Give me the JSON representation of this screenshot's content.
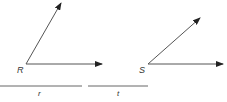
{
  "diagram": {
    "title": "",
    "angles": [
      {
        "vertex_label": "R",
        "vertex": [
          26,
          64
        ],
        "ray1_tip": [
          61,
          3
        ],
        "ray2_tip": [
          102,
          65
        ]
      },
      {
        "vertex_label": "S",
        "vertex": [
          148,
          64
        ],
        "ray1_tip": [
          200,
          18
        ],
        "ray2_tip": [
          223,
          64
        ]
      }
    ],
    "segments": [
      {
        "label": "r",
        "x1": 0,
        "x2": 82,
        "y": 86
      },
      {
        "label": "t",
        "x1": 88,
        "x2": 148,
        "y": 86
      }
    ],
    "colors": {
      "stroke": "#555555",
      "text": "#333333"
    }
  }
}
